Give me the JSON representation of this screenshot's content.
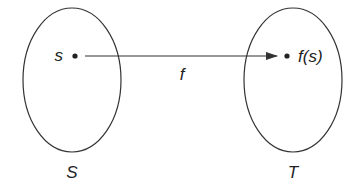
{
  "diagram": {
    "type": "function-mapping",
    "colors": {
      "stroke": "#333333",
      "text": "#222222",
      "background": "#ffffff"
    },
    "sets": [
      {
        "id": "S",
        "label": "S",
        "cx": 72,
        "cy": 80,
        "rx": 49,
        "ry": 72
      },
      {
        "id": "T",
        "label": "T",
        "cx": 293,
        "cy": 80,
        "rx": 49,
        "ry": 72
      }
    ],
    "points": [
      {
        "id": "s",
        "label": "s",
        "set": "S",
        "x": 75,
        "y": 56
      },
      {
        "id": "fs",
        "label": "f(s)",
        "set": "T",
        "x": 287,
        "y": 56
      }
    ],
    "arrow": {
      "label": "f",
      "from": "s",
      "to": "fs"
    }
  }
}
